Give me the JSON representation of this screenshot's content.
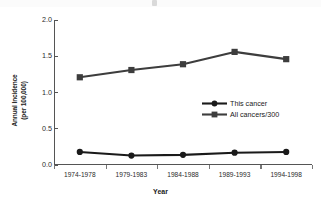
{
  "chart_data": {
    "type": "line",
    "title": "",
    "xlabel": "Year",
    "ylabel_line1": "Annual Incidence",
    "ylabel_line2": "(per 100,000)",
    "categories": [
      "1974-1978",
      "1979-1983",
      "1984-1988",
      "1989-1993",
      "1994-1998"
    ],
    "ytick_labels": [
      "0.0",
      "0.5",
      "1.0",
      "1.5",
      "2.0"
    ],
    "ytick_values": [
      0.0,
      0.5,
      1.0,
      1.5,
      2.0
    ],
    "ylim": [
      0.0,
      2.0
    ],
    "grid": false,
    "legend_position": "center-right-inside",
    "series": [
      {
        "name": "This cancer",
        "marker": "circle",
        "color": "#1a1a1a",
        "values": [
          0.18,
          0.13,
          0.14,
          0.17,
          0.18
        ]
      },
      {
        "name": "All cancers/300",
        "marker": "square",
        "color": "#3d3d3d",
        "values": [
          1.21,
          1.31,
          1.39,
          1.56,
          1.46
        ]
      }
    ]
  }
}
